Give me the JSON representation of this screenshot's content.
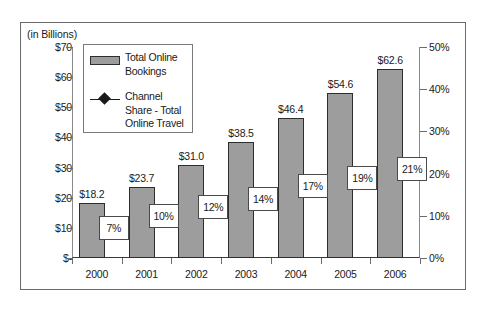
{
  "chart_data": {
    "type": "bar",
    "title": "",
    "subtitle": "",
    "units_caption": "(in Billions)",
    "xlabel": "",
    "ylabel": "",
    "categories": [
      "2000",
      "2001",
      "2002",
      "2003",
      "2004",
      "2005",
      "2006"
    ],
    "grid": false,
    "legend_position": "upper-left-inside",
    "series": [
      {
        "name": "Total Online Bookings",
        "type": "bar",
        "axis": "left",
        "values": [
          18.2,
          23.7,
          31.0,
          38.5,
          46.4,
          54.6,
          62.6
        ],
        "data_labels": [
          "$18.2",
          "$23.7",
          "$31.0",
          "$38.5",
          "$46.4",
          "$54.6",
          "$62.6"
        ],
        "color": "#9d9d9d",
        "border_color": "#2e2e2e"
      },
      {
        "name": "Channel Share - Total Online Travel",
        "type": "line",
        "axis": "right",
        "marker": "diamond",
        "values": [
          7,
          10,
          12,
          14,
          17,
          19,
          21
        ],
        "data_labels": [
          "7%",
          "10%",
          "12%",
          "14%",
          "17%",
          "19%",
          "21%"
        ],
        "color": "#1a1a1a"
      }
    ],
    "left_axis": {
      "label": "",
      "ylim": [
        0,
        70
      ],
      "tick_values": [
        0,
        10,
        20,
        30,
        40,
        50,
        60,
        70
      ],
      "tick_labels": [
        "$-",
        "$10",
        "$20",
        "$30",
        "$40",
        "$50",
        "$60",
        "$70"
      ]
    },
    "right_axis": {
      "label": "",
      "ylim": [
        0,
        50
      ],
      "tick_values": [
        0,
        10,
        20,
        30,
        40,
        50
      ],
      "tick_labels": [
        "0%",
        "10%",
        "20%",
        "30%",
        "40%",
        "50%"
      ]
    }
  },
  "legend": {
    "entries": [
      {
        "label_line1": "Total Online",
        "label_line2": "Bookings",
        "marker": "bar-swatch-icon"
      },
      {
        "label_line1": "Channel",
        "label_line2": "Share - Total",
        "label_line3": "Online Travel",
        "marker": "line-diamond-icon"
      }
    ]
  }
}
